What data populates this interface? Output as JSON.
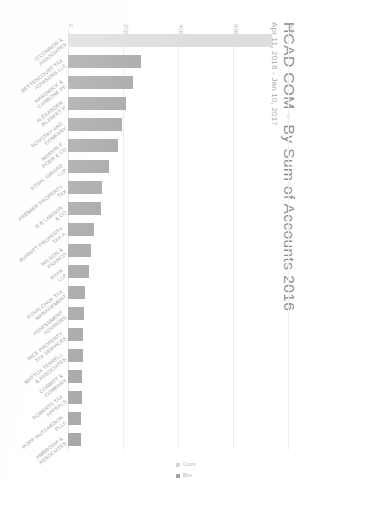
{
  "header": {
    "title": "HCAD COM - By Sum of Accounts 2016",
    "subtitle": "Apr 11, 2016 - Jan 10, 2017"
  },
  "legend": {
    "items": [
      {
        "label": "Count",
        "color": "#d9d9d9"
      },
      {
        "label": "Blue",
        "color": "#a6a6a6"
      }
    ]
  },
  "chart_data": {
    "type": "bar",
    "orientation": "horizontal",
    "title": "HCAD COM - By Sum of Accounts 2016",
    "subtitle": "Apr 11, 2016 - Jan 10, 2017",
    "xlabel": "",
    "ylabel": "",
    "xlim": [
      0,
      80000
    ],
    "grid": true,
    "legend_position": "bottom-center",
    "tick_labels": [
      "0",
      "20K",
      "40K",
      "60K",
      "80K"
    ],
    "tick_values": [
      0,
      20000,
      40000,
      60000,
      80000
    ],
    "categories": [
      "O'CONNOR & ASSOCIATES",
      "BETTENCOURT TAX ADVISORS LLC",
      "HARDWICK & CARBONE PC",
      "ALEXANDER BLANKET P.",
      "NOVOTNY AND COMPANY",
      "MARVIN F POER & CO",
      "KOVAL GIRARD LLP",
      "PREMIER PROPERTY TAX",
      "R B LAWSON & CO",
      "BURNITT PROPERTY TAX A.",
      "WILSON & FRANCO",
      "RYAN LLP",
      "KOVALCHUK TAX MANAGEMENT",
      "ASSESSMENT ADVISORS",
      "RICE PROPERTY TAX SERVICES",
      "MATTOX TERRELL & ASSOCIATES",
      "CORBITT & COMPANY",
      "ROBERTS TAX APPEALS",
      "POPP HUTCHESON PLLC",
      "AMBROSIA & ASSOCIATES"
    ],
    "values": [
      74000,
      26500,
      23500,
      21000,
      19500,
      18000,
      15000,
      12500,
      12000,
      9500,
      8500,
      7500,
      6000,
      5800,
      5600,
      5400,
      5200,
      5000,
      4800,
      4600
    ],
    "bar_colors": [
      "#dedede",
      "#a8a8a8",
      "#a8a8a8",
      "#a8a8a8",
      "#a8a8a8",
      "#a8a8a8",
      "#a8a8a8",
      "#a8a8a8",
      "#a8a8a8",
      "#a8a8a8",
      "#a8a8a8",
      "#a8a8a8",
      "#a8a8a8",
      "#a8a8a8",
      "#a8a8a8",
      "#a8a8a8",
      "#a8a8a8",
      "#a8a8a8",
      "#a8a8a8",
      "#a8a8a8"
    ]
  }
}
